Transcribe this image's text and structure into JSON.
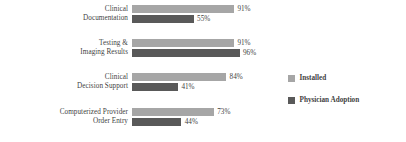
{
  "chart_data": {
    "type": "bar",
    "orientation": "horizontal",
    "title": "",
    "subtitle": "",
    "xlabel": "",
    "ylabel": "",
    "xlim": [
      0,
      100
    ],
    "grid": false,
    "legend_position": "right",
    "value_suffix": "%",
    "categories": [
      "Clinical Documentation",
      "Testing & Imaging Results",
      "Clinical Decision Support",
      "Computerized Provider Order Entry"
    ],
    "category_lines": [
      [
        "Clinical",
        "Documentation"
      ],
      [
        "Testing &",
        "Imaging Results"
      ],
      [
        "Clinical",
        "Decision Support"
      ],
      [
        "Computerized Provider",
        "Order Entry"
      ]
    ],
    "series": [
      {
        "name": "Installed",
        "color": "#a6a6a6",
        "values": [
          91,
          91,
          84,
          73
        ],
        "labels": [
          "91%",
          "91%",
          "84%",
          "73%"
        ]
      },
      {
        "name": "Physician Adoption",
        "color": "#595959",
        "values": [
          55,
          96,
          41,
          44
        ],
        "labels": [
          "55%",
          "96%",
          "41%",
          "44%"
        ]
      }
    ]
  },
  "legend": {
    "items": [
      {
        "label": "Installed",
        "color": "#a6a6a6"
      },
      {
        "label": "Physician Adoption",
        "color": "#595959"
      }
    ]
  }
}
